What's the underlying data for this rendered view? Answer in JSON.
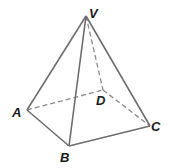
{
  "diagram": {
    "type": "square pyramid",
    "vertices": {
      "V": {
        "label": "V",
        "x": 86,
        "y": 16,
        "label_x": 89,
        "label_y": 18
      },
      "A": {
        "label": "A",
        "x": 27,
        "y": 110,
        "label_x": 12,
        "label_y": 117
      },
      "B": {
        "label": "B",
        "x": 69,
        "y": 146,
        "label_x": 60,
        "label_y": 162
      },
      "C": {
        "label": "C",
        "x": 150,
        "y": 126,
        "label_x": 151,
        "label_y": 131
      },
      "D": {
        "label": "D",
        "x": 103,
        "y": 90,
        "label_x": 96,
        "label_y": 105
      }
    },
    "edges": [
      {
        "from": "V",
        "to": "A",
        "style": "solid"
      },
      {
        "from": "V",
        "to": "B",
        "style": "solid"
      },
      {
        "from": "V",
        "to": "C",
        "style": "solid"
      },
      {
        "from": "V",
        "to": "D",
        "style": "dashed"
      },
      {
        "from": "A",
        "to": "B",
        "style": "solid"
      },
      {
        "from": "B",
        "to": "C",
        "style": "solid"
      },
      {
        "from": "A",
        "to": "D",
        "style": "dashed"
      },
      {
        "from": "D",
        "to": "C",
        "style": "dashed"
      }
    ],
    "colors": {
      "solid_edge": "#6e6e6e",
      "dashed_edge": "#8a8a8a",
      "label": "#1a1a1a",
      "background": "#ffffff"
    }
  }
}
